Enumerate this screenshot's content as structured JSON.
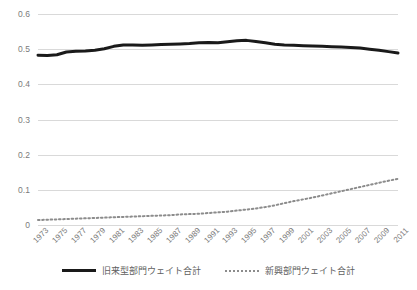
{
  "chart_data": {
    "type": "line",
    "title": "",
    "xlabel": "",
    "ylabel": "",
    "ylim": [
      0,
      0.6
    ],
    "yticks": [
      0,
      0.1,
      0.2,
      0.3,
      0.4,
      0.5,
      0.6
    ],
    "ytick_labels": [
      "0",
      "0.1",
      "0.2",
      "0.3",
      "0.4",
      "0.5",
      "0.6"
    ],
    "grid": true,
    "legend_position": "bottom",
    "x": [
      1973,
      1974,
      1975,
      1976,
      1977,
      1978,
      1979,
      1980,
      1981,
      1982,
      1983,
      1984,
      1985,
      1986,
      1987,
      1988,
      1989,
      1990,
      1991,
      1992,
      1993,
      1994,
      1995,
      1996,
      1997,
      1998,
      1999,
      2000,
      2001,
      2002,
      2003,
      2004,
      2005,
      2006,
      2007,
      2008,
      2009,
      2010,
      2011
    ],
    "xtick_labels": [
      "1973",
      "1975",
      "1977",
      "1979",
      "1981",
      "1983",
      "1985",
      "1987",
      "1989",
      "1991",
      "1993",
      "1995",
      "1997",
      "1999",
      "2001",
      "2003",
      "2005",
      "2007",
      "2009",
      "2011"
    ],
    "series": [
      {
        "name": "旧来型部門ウェイト合計",
        "style": "solid",
        "color": "#1a1a1a",
        "values": [
          0.483,
          0.482,
          0.484,
          0.492,
          0.494,
          0.495,
          0.497,
          0.501,
          0.508,
          0.512,
          0.512,
          0.511,
          0.512,
          0.513,
          0.514,
          0.515,
          0.516,
          0.518,
          0.519,
          0.518,
          0.521,
          0.524,
          0.525,
          0.522,
          0.518,
          0.514,
          0.512,
          0.511,
          0.51,
          0.509,
          0.508,
          0.507,
          0.506,
          0.505,
          0.503,
          0.5,
          0.497,
          0.493,
          0.489
        ]
      },
      {
        "name": "新興部門ウェイト合計",
        "style": "dotted",
        "color": "#8c8c8c",
        "values": [
          0.014,
          0.015,
          0.016,
          0.017,
          0.018,
          0.019,
          0.02,
          0.021,
          0.022,
          0.023,
          0.024,
          0.025,
          0.026,
          0.027,
          0.028,
          0.03,
          0.031,
          0.032,
          0.034,
          0.036,
          0.038,
          0.041,
          0.044,
          0.047,
          0.051,
          0.056,
          0.062,
          0.068,
          0.073,
          0.078,
          0.084,
          0.09,
          0.096,
          0.102,
          0.108,
          0.114,
          0.12,
          0.126,
          0.131
        ]
      }
    ]
  },
  "legend": {
    "items": [
      {
        "label": "旧来型部門ウェイト合計"
      },
      {
        "label": "新興部門ウェイト合計"
      }
    ]
  }
}
